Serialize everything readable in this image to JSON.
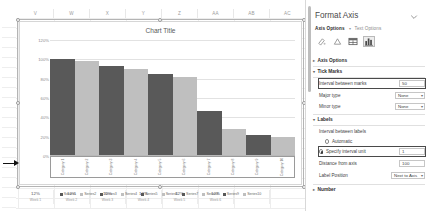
{
  "spreadsheet": {
    "column_headers": [
      "V",
      "W",
      "X",
      "Y",
      "Z",
      "AA",
      "AB",
      "AC"
    ],
    "row_headers": [
      "",
      "",
      "",
      "",
      "",
      "",
      "",
      "",
      "",
      "",
      "",
      "",
      "",
      "",
      "",
      "",
      "",
      "",
      ""
    ],
    "value_row": [
      "12%",
      "12%",
      "12%",
      "12%",
      "12%",
      "12%",
      "",
      ""
    ],
    "sub_row": [
      "Week 1",
      "Week 2",
      "Week 3",
      "Week 4",
      "Week 5",
      "Week 6",
      "",
      ""
    ]
  },
  "chart_data": {
    "type": "bar",
    "title": "Chart Title",
    "xlabel": "",
    "ylabel": "",
    "ylim": [
      0,
      1.2
    ],
    "ytick_labels": [
      "120%",
      "100%",
      "80%",
      "60%",
      "40%",
      "20%",
      "0%"
    ],
    "ytick_values": [
      1.2,
      1.0,
      0.8,
      0.6,
      0.4,
      0.2,
      0
    ],
    "grid": true,
    "legend_position": "bottom",
    "categories": [
      "Category 1",
      "Category 2",
      "Category 3",
      "Category 4",
      "Category 5",
      "Category 6",
      "Category 7",
      "Category 8",
      "Category 9",
      "Category 10"
    ],
    "values": [
      1.0,
      0.98,
      0.93,
      0.9,
      0.85,
      0.82,
      0.47,
      0.28,
      0.22,
      0.2
    ],
    "bar_colors": [
      "#595959",
      "#bfbfbf",
      "#595959",
      "#bfbfbf",
      "#595959",
      "#bfbfbf",
      "#595959",
      "#bfbfbf",
      "#595959",
      "#bfbfbf"
    ],
    "legend": [
      {
        "label": "Series1",
        "color": "#595959"
      },
      {
        "label": "Series2",
        "color": "#bfbfbf"
      },
      {
        "label": "Series3",
        "color": "#595959"
      },
      {
        "label": "Series4",
        "color": "#bfbfbf"
      },
      {
        "label": "Series5",
        "color": "#595959"
      },
      {
        "label": "Series6",
        "color": "#bfbfbf"
      },
      {
        "label": "Series7",
        "color": "#595959"
      },
      {
        "label": "Series8",
        "color": "#bfbfbf"
      },
      {
        "label": "Series9",
        "color": "#595959"
      },
      {
        "label": "Series10",
        "color": "#bfbfbf"
      }
    ]
  },
  "pane": {
    "title": "Format Axis",
    "collapse_icon": "chevron-down-icon",
    "tabs": [
      {
        "label": "Axis Options",
        "active": true
      },
      {
        "label": "Text Options",
        "active": false
      }
    ],
    "icon_buttons": [
      {
        "name": "fill-line-icon",
        "selected": false
      },
      {
        "name": "effects-icon",
        "selected": false
      },
      {
        "name": "size-properties-icon",
        "selected": false
      },
      {
        "name": "axis-options-icon",
        "selected": true
      }
    ],
    "sections": [
      {
        "name": "axis-options",
        "label": "Axis Options",
        "expanded": false
      },
      {
        "name": "tick-marks",
        "label": "Tick Marks",
        "expanded": true
      },
      {
        "name": "labels",
        "label": "Labels",
        "expanded": true
      },
      {
        "name": "number",
        "label": "Number",
        "expanded": false
      }
    ],
    "tick_marks": {
      "interval_label": "Interval between marks",
      "interval_value": "50",
      "major_type_label": "Major type",
      "major_type_value": "None",
      "minor_type_label": "Minor type",
      "minor_type_value": "None"
    },
    "labels": {
      "interval_between_labels": "Interval between labels",
      "automatic_label": "Automatic",
      "specify_interval_label": "Specify interval unit",
      "specify_interval_value": "1",
      "distance_from_axis_label": "Distance from axis",
      "distance_from_axis_value": "100",
      "label_position_label": "Label Position",
      "label_position_value": "Next to Axis"
    }
  }
}
